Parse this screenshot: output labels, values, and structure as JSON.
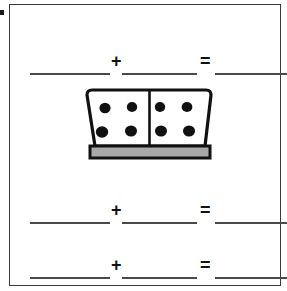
{
  "page": {
    "background_color": "#ffffff",
    "frame_color": "#3a3a3a",
    "line_color": "#4a4a4a",
    "ink_color": "#111111"
  },
  "margin_mark": {
    "name": "margin-mark",
    "color": "#1a1a1a"
  },
  "domino": {
    "left_pips": 4,
    "right_pips": 4,
    "total_pips": 8,
    "face_color": "#ffffff",
    "pip_color": "#111111",
    "edge_color": "#111111",
    "base_color": "#a8a8a8",
    "left_pip_positions": [
      {
        "cx": 21,
        "cy": 20
      },
      {
        "cx": 48,
        "cy": 19
      },
      {
        "cx": 18,
        "cy": 44
      },
      {
        "cx": 47,
        "cy": 43
      }
    ],
    "right_pip_positions": [
      {
        "cx": 76,
        "cy": 19
      },
      {
        "cx": 103,
        "cy": 19
      },
      {
        "cx": 77,
        "cy": 43
      },
      {
        "cx": 105,
        "cy": 43
      }
    ]
  },
  "equations": {
    "plus_symbol": "+",
    "equals_symbol": "=",
    "rows": [
      {
        "name": "equation-row-1",
        "addend_1": "",
        "addend_2": "",
        "sum": ""
      },
      {
        "name": "equation-row-2",
        "addend_1": "",
        "addend_2": "",
        "sum": ""
      },
      {
        "name": "equation-row-3",
        "addend_1": "",
        "addend_2": "",
        "sum": ""
      }
    ]
  }
}
